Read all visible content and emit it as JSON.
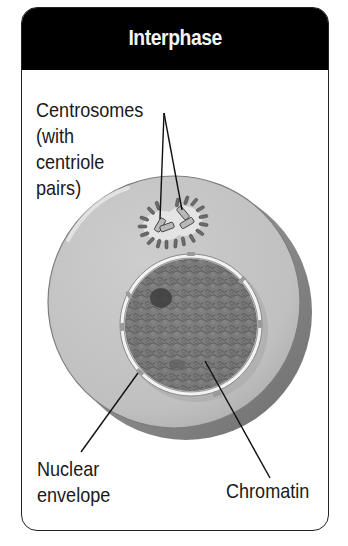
{
  "header": {
    "title": "Interphase"
  },
  "labels": {
    "centrosomes": {
      "lines": [
        "Centrosomes",
        "(with",
        "centriole",
        "pairs)"
      ]
    },
    "nuclear_envelope": {
      "lines": [
        "Nuclear",
        "envelope"
      ]
    },
    "chromatin": {
      "lines": [
        "Chromatin"
      ]
    }
  },
  "structures": {
    "cell": "cell-body",
    "nucleus": "nucleus",
    "nucleolus": "nucleolus",
    "centrosomes": "centrosome-pair"
  },
  "colors": {
    "header_bg": "#000000",
    "header_text": "#f4f4f4",
    "cytoplasm": "#c2c2c2",
    "cell_shadow": "#8e8e8e",
    "nucleus": "#7a7a7a",
    "nuclear_envelope": "#f0f0f0",
    "label_text": "#1a1a1a",
    "leader_line": "#111111"
  }
}
